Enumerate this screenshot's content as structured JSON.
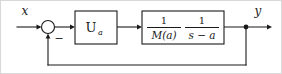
{
  "diagram": {
    "type": "control-block-diagram",
    "background_color": "#ffffff",
    "line_color": "#1a1a1a",
    "border_color": "#d8d8d8",
    "signals": {
      "input_label": "x",
      "output_label": "y",
      "feedback_sign": "−"
    },
    "summing_junction": {
      "name": "summing-junction",
      "shape": "circle",
      "cx": 47,
      "cy": 26,
      "r": 6.5,
      "inputs": [
        "x",
        "feedback"
      ],
      "sign_label": "−"
    },
    "blocks": [
      {
        "id": "controller",
        "label_main": "U",
        "label_sub": "a",
        "x": 74,
        "y": 10,
        "width": 42,
        "height": 33
      },
      {
        "id": "plant",
        "x": 141,
        "y": 10,
        "width": 82,
        "height": 33,
        "fractions": [
          {
            "numerator": "1",
            "denominator": "M(a)"
          },
          {
            "numerator": "1",
            "denominator": "s − a"
          }
        ]
      }
    ],
    "branch_point": {
      "name": "output-branch-node",
      "cx": 245,
      "cy": 26
    },
    "feedback_path": {
      "name": "feedback-path",
      "from": "output-branch-node",
      "to": "summing-junction",
      "bottom_y": 64,
      "left_x": 47
    }
  }
}
